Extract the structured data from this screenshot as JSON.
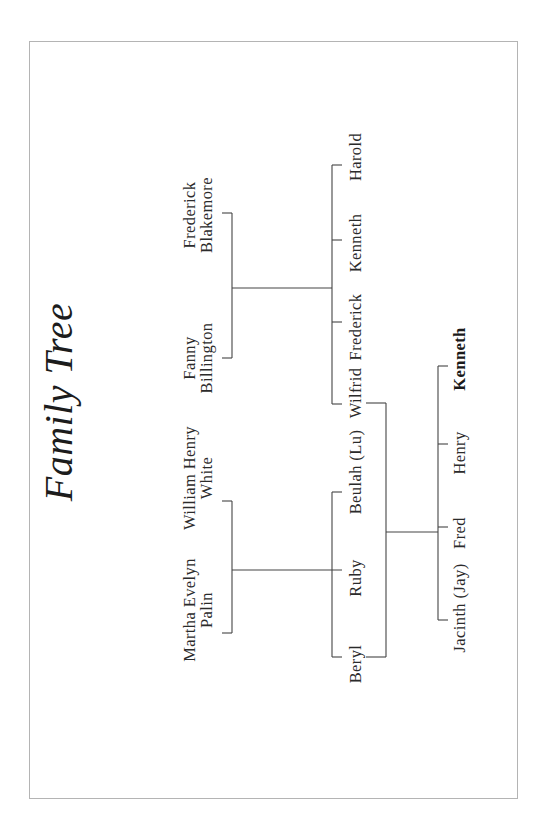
{
  "title": "Family Tree",
  "grandparents": {
    "blakemore_couple": {
      "father": {
        "line1": "Frederick",
        "line2": "Blakemore"
      },
      "mother": {
        "line1": "Fanny",
        "line2": "Billington"
      }
    },
    "white_couple": {
      "father": {
        "line1": "William Henry",
        "line2": "White"
      },
      "mother": {
        "line1": "Martha Evelyn",
        "line2": "Palin"
      }
    }
  },
  "blakemore_children": [
    "Harold",
    "Kenneth",
    "Frederick",
    "Wilfrid"
  ],
  "white_children": [
    "Beulah (Lu)",
    "Ruby",
    "Beryl"
  ],
  "couple": {
    "husband": "Wilfrid",
    "wife": "Beryl"
  },
  "grandchildren": [
    {
      "name": "Kenneth",
      "highlighted": true
    },
    {
      "name": "Henry",
      "highlighted": false
    },
    {
      "name": "Fred",
      "highlighted": false
    },
    {
      "name": "Jacinth (Jay)",
      "highlighted": false
    }
  ]
}
